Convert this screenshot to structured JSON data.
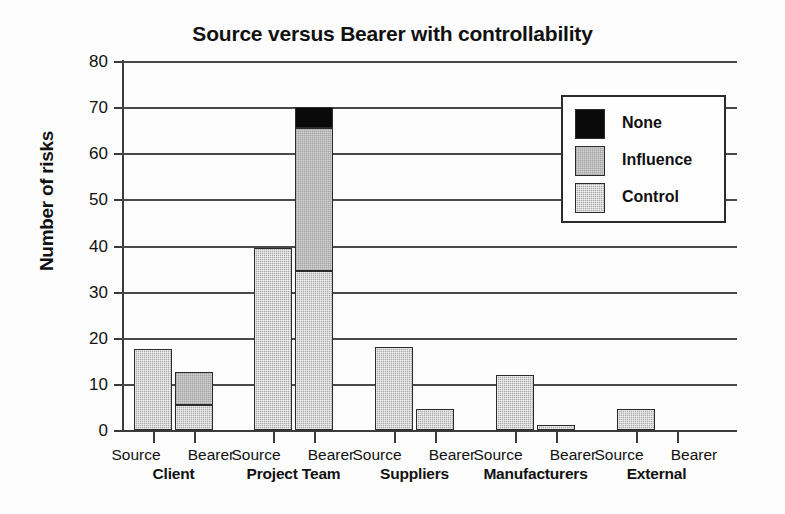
{
  "chart_data": {
    "type": "bar",
    "title": "Source versus Bearer with controllability",
    "xlabel": "",
    "ylabel": "Number of risks",
    "ylim": [
      0,
      80
    ],
    "ytick_step": 10,
    "yticks": [
      80,
      70,
      60,
      50,
      40,
      30,
      20,
      10,
      0
    ],
    "grid": true,
    "stacked": true,
    "legend_position": "top-right",
    "legend": [
      {
        "name": "None",
        "color": "#0a0a0a"
      },
      {
        "name": "Influence",
        "color": "#d6d6d6"
      },
      {
        "name": "Control",
        "color": "#aaaaaa"
      }
    ],
    "groups": [
      "Client",
      "Project Team",
      "Suppliers",
      "Manufacturers",
      "External"
    ],
    "roles": [
      "Source",
      "Bearer"
    ],
    "series": [
      {
        "name": "Control",
        "values": [
          17.5,
          5.5,
          39.5,
          34.5,
          18,
          4.5,
          12,
          1,
          4.5,
          0
        ]
      },
      {
        "name": "Influence",
        "values": [
          0,
          7,
          0,
          31,
          0,
          0,
          0,
          0,
          0,
          0
        ]
      },
      {
        "name": "None",
        "values": [
          0,
          0,
          0,
          4.5,
          0,
          0,
          0,
          0,
          0,
          0
        ]
      }
    ],
    "bars": [
      {
        "group": "Client",
        "role": "Source",
        "control": 17.5,
        "influence": 0,
        "none": 0,
        "total": 17.5
      },
      {
        "group": "Client",
        "role": "Bearer",
        "control": 5.5,
        "influence": 7,
        "none": 0,
        "total": 12.5
      },
      {
        "group": "Project Team",
        "role": "Source",
        "control": 39.5,
        "influence": 0,
        "none": 0,
        "total": 39.5
      },
      {
        "group": "Project Team",
        "role": "Bearer",
        "control": 34.5,
        "influence": 31,
        "none": 4.5,
        "total": 70
      },
      {
        "group": "Suppliers",
        "role": "Source",
        "control": 18,
        "influence": 0,
        "none": 0,
        "total": 18
      },
      {
        "group": "Suppliers",
        "role": "Bearer",
        "control": 4.5,
        "influence": 0,
        "none": 0,
        "total": 4.5
      },
      {
        "group": "Manufacturers",
        "role": "Source",
        "control": 12,
        "influence": 0,
        "none": 0,
        "total": 12
      },
      {
        "group": "Manufacturers",
        "role": "Bearer",
        "control": 1,
        "influence": 0,
        "none": 0,
        "total": 1
      },
      {
        "group": "External",
        "role": "Source",
        "control": 4.5,
        "influence": 0,
        "none": 0,
        "total": 4.5
      },
      {
        "group": "External",
        "role": "Bearer",
        "control": 0,
        "influence": 0,
        "none": 0,
        "total": 0
      }
    ]
  },
  "axis": {
    "y_title": "Number of risks"
  }
}
